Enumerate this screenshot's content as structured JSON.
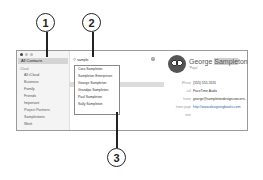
{
  "callouts": [
    "1",
    "2",
    "3"
  ],
  "sidebar": {
    "all_contacts": "All Contacts",
    "group_heading": "iCloud",
    "groups": [
      "All iCloud",
      "Business",
      "Family",
      "Friends",
      "Important",
      "Project Partners",
      "Samplestons",
      "Work"
    ]
  },
  "search": {
    "value": "sample",
    "icon": "magnifier-icon"
  },
  "results": [
    "Cora Sampleton",
    "Sampleton Enterprises",
    "George Sampleton",
    "Grandpa Sampleton",
    "Paul Sampleton",
    "Sally Sampleton"
  ],
  "selected_index": 2,
  "card": {
    "name_prefix": "George ",
    "name_highlight": "Sample",
    "name_suffix": "ton",
    "nickname": "\"Papa\"",
    "fields": [
      {
        "label": "iPhone",
        "value": "(555) 555-5555",
        "link": false
      },
      {
        "label": "call",
        "value": "FaceTime    Audio",
        "link": false
      },
      {
        "label": "home",
        "value": "george@sampletondesignconcern...",
        "link": false
      },
      {
        "label": "home page",
        "value": "http://www.designingbooks.com",
        "link": true
      },
      {
        "label": "note",
        "value": "",
        "link": false
      }
    ]
  }
}
